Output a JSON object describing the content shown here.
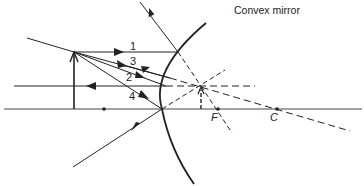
{
  "diagram": {
    "title": "Convex mirror",
    "ray_labels": [
      "1",
      "3",
      "2",
      "4"
    ],
    "point_labels": {
      "focus": "F",
      "center": "C"
    },
    "colors": {
      "line": "#222222",
      "background": "#ffffff"
    }
  }
}
